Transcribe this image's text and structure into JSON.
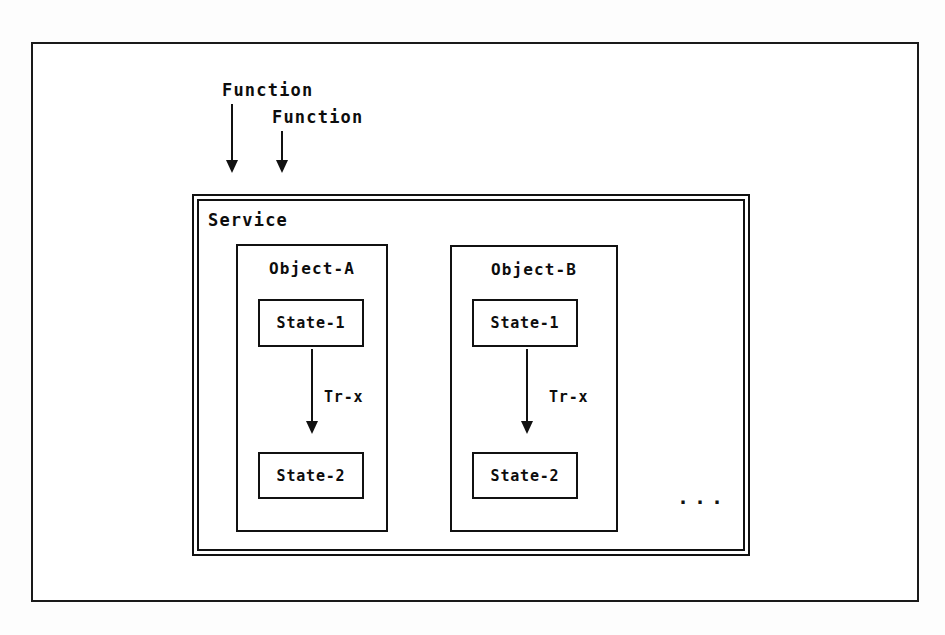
{
  "diagram": {
    "background_color": "#fdfdfd",
    "line_color": "#111111",
    "text_color": "#0d0d0d",
    "inputs": [
      {
        "label": "Function",
        "arrow": "down-arrow-icon"
      },
      {
        "label": "Function",
        "arrow": "down-arrow-icon"
      }
    ],
    "service": {
      "label": "Service",
      "border_style": "double",
      "objects": [
        {
          "label": "Object-A",
          "states": [
            {
              "label": "State-1"
            },
            {
              "label": "State-2"
            }
          ],
          "transition": {
            "label": "Tr-x",
            "from": "State-1",
            "to": "State-2",
            "arrow": "down-arrow-icon"
          }
        },
        {
          "label": "Object-B",
          "states": [
            {
              "label": "State-1"
            },
            {
              "label": "State-2"
            }
          ],
          "transition": {
            "label": "Tr-x",
            "from": "State-1",
            "to": "State-2",
            "arrow": "down-arrow-icon"
          }
        }
      ],
      "more_indicator": "..."
    },
    "caption_sliver": ""
  }
}
